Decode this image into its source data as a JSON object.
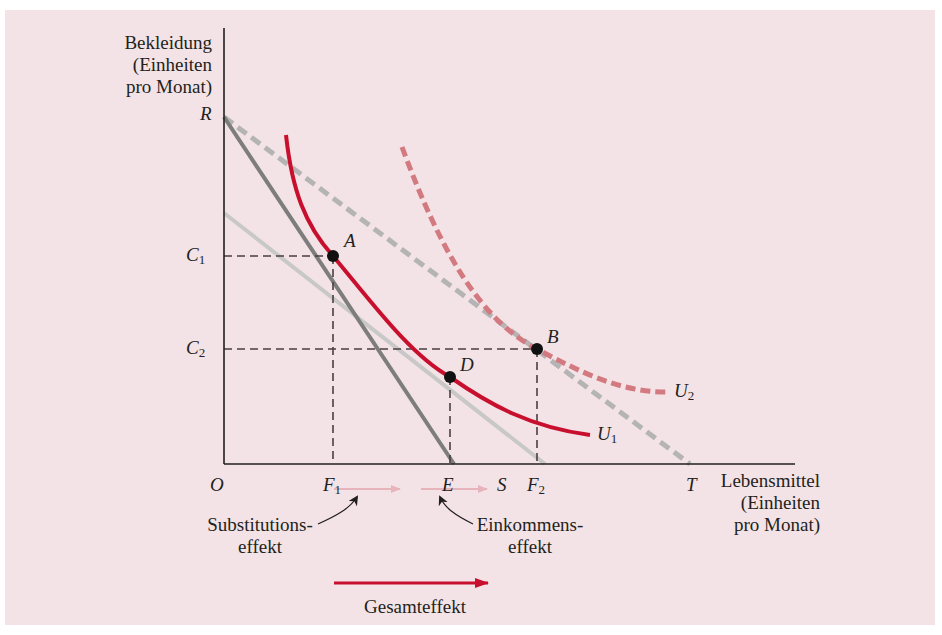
{
  "figure": {
    "y_axis_label": [
      "Bekleidung",
      "(Einheiten",
      "pro Monat)"
    ],
    "x_axis_label": [
      "Lebensmittel",
      "(Einheiten",
      "pro Monat)"
    ],
    "origin_label": "O",
    "y_points": {
      "R": "R",
      "C1": "C",
      "C1_sub": "1",
      "C2": "C",
      "C2_sub": "2"
    },
    "x_points": {
      "F1": "F",
      "F1_sub": "1",
      "E": "E",
      "S": "S",
      "F2": "F",
      "F2_sub": "2",
      "T": "T"
    },
    "points": {
      "A": "A",
      "B": "B",
      "D": "D"
    },
    "curves": {
      "U1": "U",
      "U1_sub": "1",
      "U2": "U",
      "U2_sub": "2"
    },
    "effects": {
      "substitution": [
        "Substitutions-",
        "effekt"
      ],
      "income": [
        "Einkommens-",
        "effekt"
      ],
      "total": "Gesamteffekt"
    },
    "colors": {
      "background": "#f4e3e6",
      "indifference_curve": "#c8102e",
      "indifference_curve_dashed": "#d27a80",
      "budget_line_original": "#7d7d7d",
      "budget_line_new_dashed": "#b4b4b4",
      "budget_line_compensated": "#c8c8c8",
      "axis": "#231f20",
      "effect_arrow_light": "#e8b4bc",
      "total_arrow": "#c8102e"
    }
  }
}
